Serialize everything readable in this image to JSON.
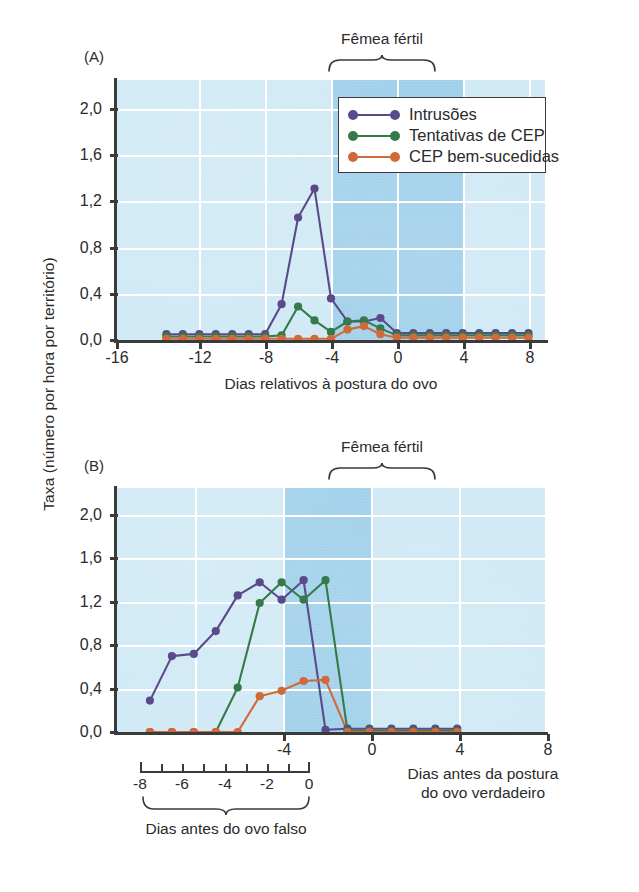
{
  "figure": {
    "y_axis_label": "Taxa (número por hora por território)",
    "panel_a_tag": "(A)",
    "panel_b_tag": "(B)"
  },
  "legend": {
    "position": "top-right-inside-panel-a",
    "items": [
      {
        "label": "Intrusões",
        "color": "#5b4a8a"
      },
      {
        "label": "Tentativas de CEP",
        "color": "#367a49"
      },
      {
        "label": "CEP bem-sucedidas",
        "color": "#d2693b"
      }
    ]
  },
  "annotations": {
    "fertile_a": "Fêmea fértil",
    "fertile_b": "Fêmea fértil",
    "false_egg_caption": "Dias antes do ovo falso",
    "true_egg_caption_line1": "Dias antes da postura",
    "true_egg_caption_line2": "do ovo verdadeiro"
  },
  "sub_axis": {
    "ticks": [
      -8,
      -7,
      -6,
      -5,
      -4,
      -3,
      -2,
      -1,
      0
    ],
    "labels": [
      "-8",
      "-6",
      "-4",
      "-2",
      "0"
    ],
    "label_values": [
      -8,
      -6,
      -4,
      -2,
      0
    ]
  },
  "colors": {
    "plot_background": "#cfe9f5",
    "fertile_band": "#9fd0ea",
    "gridline": "#ffffff",
    "axis": "#3a3a3a",
    "intrusions": "#5b4a8a",
    "epc_attempts": "#367a49",
    "epc_success": "#d2693b"
  },
  "chart_data": [
    {
      "type": "line",
      "panel": "A",
      "title": "",
      "xlabel": "Dias relativos à postura do ovo",
      "ylabel": "Taxa (número por hora por território)",
      "xlim": [
        -17,
        9
      ],
      "ylim": [
        0,
        2.25
      ],
      "xticks": [
        -16,
        -12,
        -8,
        -4,
        0,
        4,
        8
      ],
      "xtick_labels": [
        "-16",
        "-12",
        "-8",
        "-4",
        "0",
        "4",
        "8"
      ],
      "yticks": [
        0.0,
        0.4,
        0.8,
        1.2,
        1.6,
        2.0
      ],
      "ytick_labels": [
        "0,0",
        "0,4",
        "0,8",
        "1,2",
        "1,6",
        "2,0"
      ],
      "grid": true,
      "shaded_region": {
        "label": "Fêmea fértil",
        "x_start": -4,
        "x_end": 0
      },
      "x": [
        -14,
        -13,
        -12,
        -11,
        -10,
        -9,
        -8,
        -7,
        -6,
        -5,
        -4,
        -3,
        -2,
        -1,
        0,
        1,
        2,
        3,
        4,
        5,
        6,
        7,
        8
      ],
      "series": [
        {
          "name": "Intrusões",
          "color": "#5b4a8a",
          "values": [
            0.05,
            0.05,
            0.05,
            0.05,
            0.05,
            0.05,
            0.05,
            0.31,
            1.06,
            1.31,
            0.36,
            0.16,
            0.16,
            0.19,
            0.06,
            0.06,
            0.06,
            0.06,
            0.06,
            0.06,
            0.06,
            0.06,
            0.06
          ]
        },
        {
          "name": "Tentativas de CEP",
          "color": "#367a49",
          "values": [
            0.03,
            0.03,
            0.03,
            0.03,
            0.03,
            0.03,
            0.03,
            0.04,
            0.29,
            0.17,
            0.07,
            0.16,
            0.17,
            0.1,
            0.04,
            0.04,
            0.04,
            0.04,
            0.04,
            0.04,
            0.04,
            0.04,
            0.04
          ]
        },
        {
          "name": "CEP bem-sucedidas",
          "color": "#d2693b",
          "values": [
            0.01,
            0.01,
            0.01,
            0.01,
            0.01,
            0.01,
            0.01,
            0.01,
            0.01,
            0.01,
            0.01,
            0.09,
            0.12,
            0.05,
            0.02,
            0.02,
            0.02,
            0.02,
            0.02,
            0.02,
            0.02,
            0.02,
            0.02
          ]
        }
      ]
    },
    {
      "type": "line",
      "panel": "B",
      "title": "",
      "xlabel": "Dias antes da postura do ovo verdadeiro",
      "ylabel": "Taxa (número por hora por território)",
      "xlim": [
        -10.5,
        9
      ],
      "ylim": [
        0,
        2.25
      ],
      "xticks": [
        -8,
        -4,
        0,
        4,
        8
      ],
      "xtick_labels": [
        "",
        "-4",
        "0",
        "4",
        "8"
      ],
      "yticks": [
        0.0,
        0.4,
        0.8,
        1.2,
        1.6,
        2.0
      ],
      "ytick_labels": [
        "0,0",
        "0,4",
        "0,8",
        "1,2",
        "1,6",
        "2,0"
      ],
      "grid": true,
      "shaded_region": {
        "label": "Fêmea fértil",
        "x_start": -4,
        "x_end": 0
      },
      "x": [
        -9,
        -8,
        -7,
        -6,
        -5,
        -4,
        -3,
        -2,
        -1,
        0,
        1,
        2,
        3,
        4,
        5
      ],
      "series": [
        {
          "name": "Intrusões",
          "color": "#5b4a8a",
          "values": [
            0.29,
            0.7,
            0.72,
            0.93,
            1.26,
            1.38,
            1.22,
            1.4,
            0.02,
            0.03,
            0.03,
            0.03,
            0.03,
            0.03,
            0.03
          ]
        },
        {
          "name": "Tentativas de CEP",
          "color": "#367a49",
          "values": [
            0.0,
            0.0,
            0.0,
            0.0,
            0.41,
            1.19,
            1.38,
            1.22,
            1.4,
            0.01,
            0.01,
            0.01,
            0.01,
            0.01,
            0.01
          ]
        },
        {
          "name": "CEP bem-sucedidas",
          "color": "#d2693b",
          "values": [
            0.0,
            0.0,
            0.0,
            0.0,
            0.0,
            0.33,
            0.38,
            0.47,
            0.48,
            0.0,
            0.0,
            0.0,
            0.0,
            0.0,
            0.0
          ]
        }
      ]
    }
  ]
}
